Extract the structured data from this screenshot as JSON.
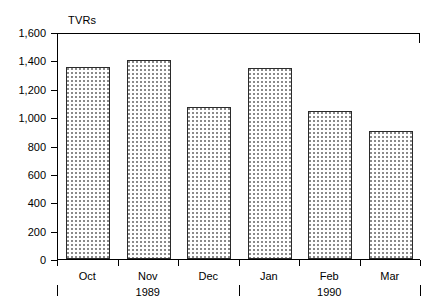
{
  "chart_data": {
    "type": "bar",
    "title": "",
    "ylabel": "TVRs",
    "xlabel": "",
    "categories": [
      "Oct",
      "Nov",
      "Dec",
      "Jan",
      "Feb",
      "Mar"
    ],
    "values": [
      1350,
      1405,
      1070,
      1345,
      1040,
      900
    ],
    "ylim": [
      0,
      1600
    ],
    "ytick_values": [
      0,
      200,
      400,
      600,
      800,
      1000,
      1200,
      1400,
      1600
    ],
    "ytick_labels": [
      "0",
      "200",
      "400",
      "600",
      "800",
      "1,000",
      "1,200",
      "1,400",
      "1,600"
    ],
    "grid": false,
    "legend": false,
    "bar_fill": "#ffffff",
    "bar_edge": "#2b2b2b",
    "bar_pattern": "dotted",
    "groups": [
      {
        "label": "1989",
        "categories": [
          "Oct",
          "Nov",
          "Dec"
        ]
      },
      {
        "label": "1990",
        "categories": [
          "Jan",
          "Feb",
          "Mar"
        ]
      }
    ]
  }
}
